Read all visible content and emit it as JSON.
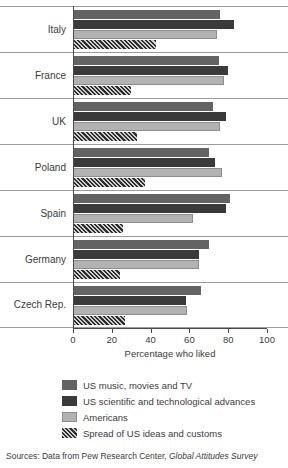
{
  "chart_data": {
    "type": "bar",
    "orientation": "horizontal",
    "title": "",
    "xlabel": "Percentage who liked",
    "ylabel": "",
    "xlim": [
      0,
      100
    ],
    "xticks": [
      0,
      20,
      40,
      60,
      80,
      100
    ],
    "grid": "horizontal-separators",
    "legend_position": "below",
    "categories": [
      "Italy",
      "France",
      "UK",
      "Poland",
      "Spain",
      "Germany",
      "Czech Rep."
    ],
    "series": [
      {
        "name": "US music, movies and TV",
        "color": "#636363",
        "values": [
          76,
          75,
          72,
          70,
          81,
          70,
          66
        ]
      },
      {
        "name": "US scientific and technological advances",
        "color": "#3a3a3a",
        "values": [
          83,
          80,
          79,
          73,
          79,
          65,
          58
        ]
      },
      {
        "name": "Americans",
        "color": "#b2b2b2",
        "values": [
          74,
          78,
          76,
          77,
          62,
          65,
          59
        ]
      },
      {
        "name": "Spread of US ideas and customs",
        "color": "#4a4a4a",
        "pattern": "diagonal-hatch",
        "values": [
          43,
          30,
          33,
          37,
          26,
          24,
          27
        ]
      }
    ],
    "source_prefix": "Sources: Data from Pew Research Center,",
    "source_italic": "Global Attitudes Survey"
  }
}
